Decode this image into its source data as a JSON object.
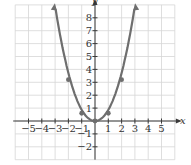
{
  "chart_data": {
    "type": "line",
    "title": "",
    "xlabel": "x",
    "ylabel": "y",
    "xlim": [
      -6,
      6
    ],
    "ylim": [
      -3,
      9
    ],
    "grid": true,
    "x_ticks": [
      -5,
      -4,
      -3,
      -2,
      -1,
      1,
      2,
      3,
      4,
      5
    ],
    "x_tick_labels": [
      "−5",
      "−4",
      "−3",
      "−2",
      "−1",
      "1",
      "2",
      "3",
      "4",
      "5"
    ],
    "y_ticks": [
      -2,
      -1,
      1,
      2,
      3,
      4,
      5,
      6,
      7,
      8
    ],
    "y_tick_labels": [
      "−2",
      "−1",
      "1",
      "2",
      "3",
      "4",
      "5",
      "6",
      "7",
      "8"
    ],
    "series": [
      {
        "name": "parabola",
        "color": "#6e6e6e",
        "x": [
          -3,
          -2,
          -1,
          0,
          1,
          2,
          3
        ],
        "y": [
          8.7,
          3.2,
          0.6,
          0,
          0.6,
          3.2,
          8.7
        ],
        "marked_points": [
          [
            -2,
            3.2
          ],
          [
            -1,
            0.6
          ],
          [
            0,
            0
          ],
          [
            1,
            0.6
          ],
          [
            2,
            3.2
          ]
        ],
        "arrows_at_ends": true
      }
    ]
  }
}
